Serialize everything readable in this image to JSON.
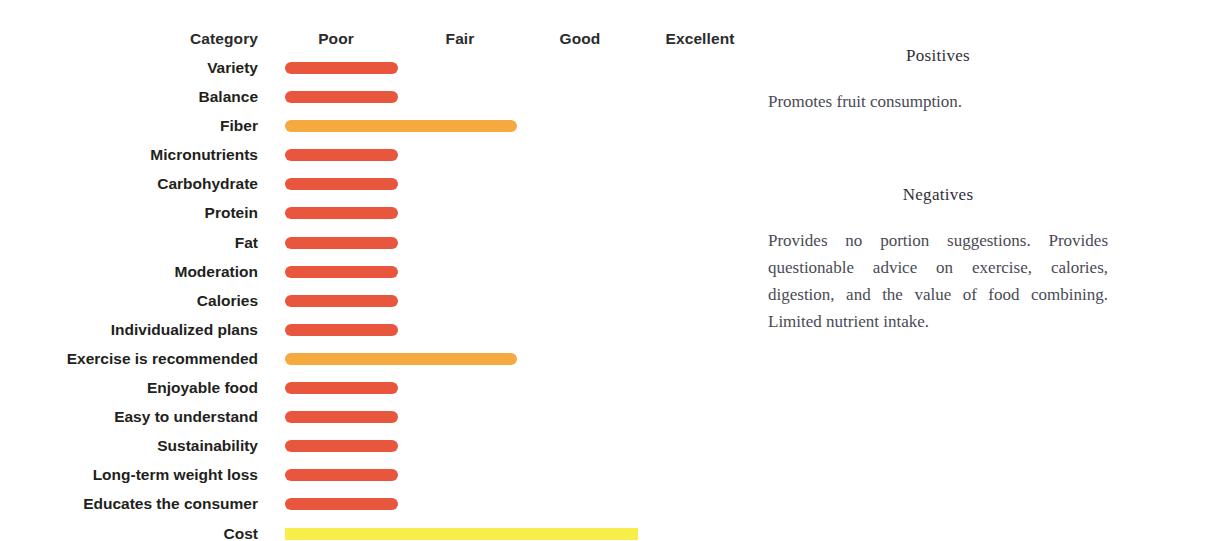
{
  "chart_data": {
    "type": "bar",
    "title": "",
    "xlabel": "",
    "ylabel": "Category",
    "orientation": "horizontal",
    "grid": false,
    "legend": false,
    "scale_labels": [
      "Poor",
      "Fair",
      "Good",
      "Excellent"
    ],
    "scale_values": [
      1,
      2,
      3,
      4
    ],
    "category_header": "Category",
    "xlim": [
      0,
      4
    ],
    "categories": [
      "Variety",
      "Balance",
      "Fiber",
      "Micronutrients",
      "Carbohydrate",
      "Protein",
      "Fat",
      "Moderation",
      "Calories",
      "Individualized plans",
      "Exercise is recommended",
      "Enjoyable food",
      "Easy to understand",
      "Sustainability",
      "Long-term weight loss",
      "Educates the consumer",
      "Cost"
    ],
    "values": [
      1.0,
      1.0,
      2.0,
      1.0,
      1.0,
      1.0,
      1.0,
      1.0,
      1.0,
      1.0,
      2.0,
      1.0,
      1.0,
      1.0,
      1.0,
      1.0,
      3.05
    ],
    "bar_colors": [
      "#E8563D",
      "#E8563D",
      "#F6A93E",
      "#E8563D",
      "#E8563D",
      "#E8563D",
      "#E8563D",
      "#E8563D",
      "#E8563D",
      "#E8563D",
      "#F6A93E",
      "#E8563D",
      "#E8563D",
      "#E8563D",
      "#E8563D",
      "#E8563D",
      "#F7EE4A"
    ]
  },
  "chart": {
    "rows": [
      {
        "label": "Variety",
        "rating": "Poor",
        "bar_end_px": 398,
        "color": "#E8563D",
        "flat": false
      },
      {
        "label": "Balance",
        "rating": "Poor",
        "bar_end_px": 398,
        "color": "#E8563D",
        "flat": false
      },
      {
        "label": "Fiber",
        "rating": "Fair",
        "bar_end_px": 517,
        "color": "#F6A93E",
        "flat": false
      },
      {
        "label": "Micronutrients",
        "rating": "Poor",
        "bar_end_px": 398,
        "color": "#E8563D",
        "flat": false
      },
      {
        "label": "Carbohydrate",
        "rating": "Poor",
        "bar_end_px": 398,
        "color": "#E8563D",
        "flat": false
      },
      {
        "label": "Protein",
        "rating": "Poor",
        "bar_end_px": 398,
        "color": "#E8563D",
        "flat": false
      },
      {
        "label": "Fat",
        "rating": "Poor",
        "bar_end_px": 398,
        "color": "#E8563D",
        "flat": false
      },
      {
        "label": "Moderation",
        "rating": "Poor",
        "bar_end_px": 398,
        "color": "#E8563D",
        "flat": false
      },
      {
        "label": "Calories",
        "rating": "Poor",
        "bar_end_px": 398,
        "color": "#E8563D",
        "flat": false
      },
      {
        "label": "Individualized plans",
        "rating": "Poor",
        "bar_end_px": 398,
        "color": "#E8563D",
        "flat": false
      },
      {
        "label": "Exercise is recommended",
        "rating": "Fair",
        "bar_end_px": 517,
        "color": "#F6A93E",
        "flat": false
      },
      {
        "label": "Enjoyable food",
        "rating": "Poor",
        "bar_end_px": 398,
        "color": "#E8563D",
        "flat": false
      },
      {
        "label": "Easy to understand",
        "rating": "Poor",
        "bar_end_px": 398,
        "color": "#E8563D",
        "flat": false
      },
      {
        "label": "Sustainability",
        "rating": "Poor",
        "bar_end_px": 398,
        "color": "#E8563D",
        "flat": false
      },
      {
        "label": "Long-term weight loss",
        "rating": "Poor",
        "bar_end_px": 398,
        "color": "#E8563D",
        "flat": false
      },
      {
        "label": "Educates the consumer",
        "rating": "Poor",
        "bar_end_px": 398,
        "color": "#E8563D",
        "flat": false
      },
      {
        "label": "Cost",
        "rating": "Good",
        "bar_end_px": 638,
        "color": "#F7EE4A",
        "flat": true
      }
    ],
    "scale_positions_px": [
      336,
      460,
      580,
      700
    ],
    "category_header_x_px": 258,
    "bar_origin_px": 285
  },
  "notes": {
    "positives": {
      "title": "Positives",
      "body": "Promotes fruit consumption."
    },
    "negatives": {
      "title": "Negatives",
      "body": "Provides no portion suggestions. Provides questionable advice on exercise, calories, digestion, and the value of food combining. Limited nutrient intake."
    }
  }
}
